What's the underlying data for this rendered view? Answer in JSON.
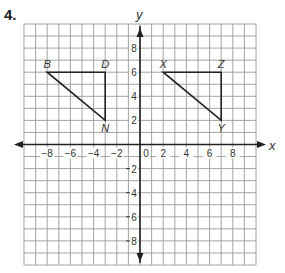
{
  "problem": {
    "number": "4."
  },
  "axes": {
    "x_label": "x",
    "y_label": "y",
    "origin_label": "0",
    "x_range": [
      -10,
      10
    ],
    "y_range": [
      -10,
      10
    ],
    "x_tick_labels": [
      {
        "value": -8,
        "label": "−8"
      },
      {
        "value": -6,
        "label": "−6"
      },
      {
        "value": -4,
        "label": "−4"
      },
      {
        "value": -2,
        "label": "−2"
      },
      {
        "value": 2,
        "label": "2"
      },
      {
        "value": 4,
        "label": "4"
      },
      {
        "value": 6,
        "label": "6"
      },
      {
        "value": 8,
        "label": "8"
      }
    ],
    "y_tick_labels": [
      {
        "value": 8,
        "label": "8"
      },
      {
        "value": 6,
        "label": "6"
      },
      {
        "value": 4,
        "label": "4"
      },
      {
        "value": 2,
        "label": "2"
      },
      {
        "value": -2,
        "label": "2"
      },
      {
        "value": -4,
        "label": "4"
      },
      {
        "value": -6,
        "label": "6"
      },
      {
        "value": -8,
        "label": "8"
      }
    ]
  },
  "figures": [
    {
      "name": "triangle-BDN",
      "vertices": [
        {
          "label": "B",
          "x": -8,
          "y": 6
        },
        {
          "label": "D",
          "x": -3,
          "y": 6
        },
        {
          "label": "N",
          "x": -3,
          "y": 2
        }
      ]
    },
    {
      "name": "triangle-XZY",
      "vertices": [
        {
          "label": "X",
          "x": 2,
          "y": 6
        },
        {
          "label": "Z",
          "x": 7,
          "y": 6
        },
        {
          "label": "Y",
          "x": 7,
          "y": 2
        }
      ]
    }
  ],
  "colors": {
    "grid": "#9a9a9a",
    "axis": "#222222",
    "figure": "#222222"
  }
}
